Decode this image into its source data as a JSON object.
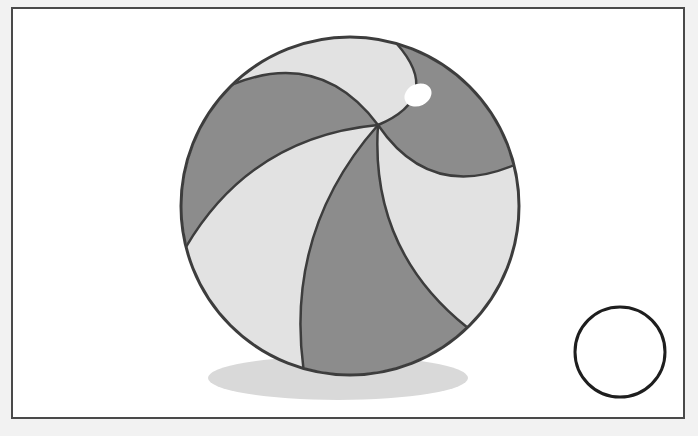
{
  "canvas": {
    "width": 698,
    "height": 436,
    "background_color": "#f2f2f2",
    "title": "Beach Ball Illustration"
  },
  "frame": {
    "name": "illustration-frame",
    "x": 12,
    "y": 8,
    "width": 672,
    "height": 410,
    "fill_color": "#ffffff",
    "stroke_color": "#4a4a4a",
    "stroke_width": 2
  },
  "shadow": {
    "name": "ball-shadow",
    "cx": 338,
    "cy": 378,
    "rx": 130,
    "ry": 22,
    "fill_color": "#d9d9d9"
  },
  "ball": {
    "name": "beach-ball",
    "cx": 350,
    "cy": 206,
    "r": 169,
    "outline_color": "#3d3d3d",
    "outline_width": 3,
    "pole_x": 378,
    "pole_y": 125,
    "segment_colors": {
      "light": "#e2e2e2",
      "dark": "#8c8c8c"
    },
    "segment_divider_color": "#3d3d3d",
    "segment_divider_width": 2.5,
    "segments": [
      {
        "name": "segment-1",
        "shade": "light"
      },
      {
        "name": "segment-2",
        "shade": "dark"
      },
      {
        "name": "segment-3",
        "shade": "light"
      },
      {
        "name": "segment-4",
        "shade": "dark"
      },
      {
        "name": "segment-5",
        "shade": "light"
      },
      {
        "name": "segment-6",
        "shade": "dark"
      }
    ]
  },
  "highlight": {
    "name": "ball-highlight",
    "cx": 418,
    "cy": 95,
    "rx": 14,
    "ry": 11,
    "rotation": -25,
    "fill_color": "#ffffff"
  },
  "small_circle": {
    "name": "small-empty-circle",
    "cx": 620,
    "cy": 352,
    "r": 45,
    "fill_color": "#ffffff",
    "stroke_color": "#1e1e1e",
    "stroke_width": 3
  }
}
